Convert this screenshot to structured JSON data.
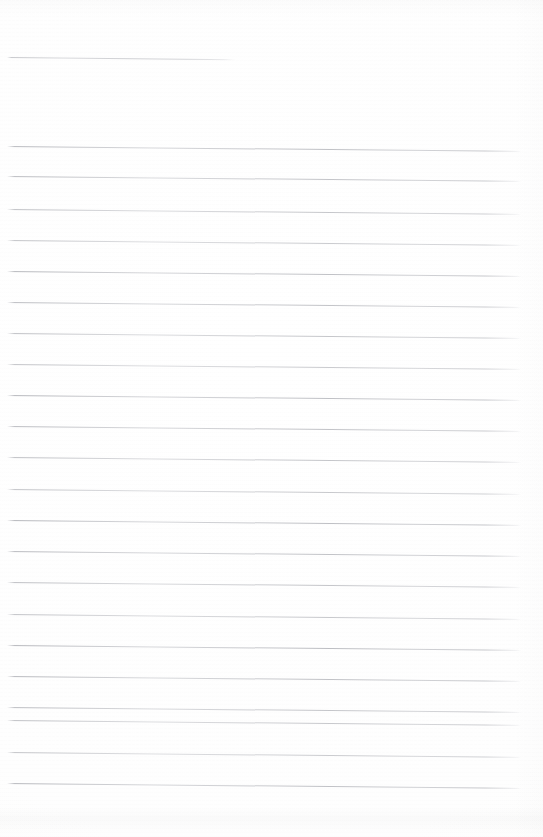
{
  "document": {
    "kind": "scanned-lined-page",
    "page_label": "",
    "background_color": "#fdfdfd",
    "line_color": "#94969e",
    "width_px": 543,
    "height_px": 837,
    "text_content": "",
    "has_handwriting": false,
    "line_count": 23
  },
  "ruling": {
    "left_margin_px": 7,
    "right_end_px": 521,
    "line_spacing_px": 31,
    "skew_deg": 0.55,
    "first_full_line_y_px": 146,
    "last_line_y_px": 783
  },
  "lines": [
    {
      "id": "line-01",
      "y": 57,
      "x": 7,
      "width": 228,
      "short": true
    },
    {
      "id": "line-02",
      "y": 146,
      "x": 7,
      "width": 514,
      "short": false
    },
    {
      "id": "line-03",
      "y": 176,
      "x": 7,
      "width": 514,
      "short": false
    },
    {
      "id": "line-04",
      "y": 209,
      "x": 7,
      "width": 514,
      "short": false
    },
    {
      "id": "line-05",
      "y": 240,
      "x": 7,
      "width": 514,
      "short": false
    },
    {
      "id": "line-06",
      "y": 271,
      "x": 7,
      "width": 514,
      "short": false
    },
    {
      "id": "line-07",
      "y": 302,
      "x": 7,
      "width": 514,
      "short": false
    },
    {
      "id": "line-08",
      "y": 333,
      "x": 7,
      "width": 514,
      "short": false
    },
    {
      "id": "line-09",
      "y": 364,
      "x": 7,
      "width": 514,
      "short": false
    },
    {
      "id": "line-10",
      "y": 395,
      "x": 7,
      "width": 514,
      "short": false
    },
    {
      "id": "line-11",
      "y": 426,
      "x": 7,
      "width": 514,
      "short": false
    },
    {
      "id": "line-12",
      "y": 457,
      "x": 7,
      "width": 514,
      "short": false
    },
    {
      "id": "line-13",
      "y": 489,
      "x": 7,
      "width": 514,
      "short": false
    },
    {
      "id": "line-14",
      "y": 520,
      "x": 7,
      "width": 514,
      "short": false
    },
    {
      "id": "line-15",
      "y": 551,
      "x": 7,
      "width": 514,
      "short": false
    },
    {
      "id": "line-16",
      "y": 582,
      "x": 7,
      "width": 514,
      "short": false
    },
    {
      "id": "line-17",
      "y": 614,
      "x": 7,
      "width": 514,
      "short": false
    },
    {
      "id": "line-18",
      "y": 645,
      "x": 7,
      "width": 514,
      "short": false
    },
    {
      "id": "line-19",
      "y": 676,
      "x": 7,
      "width": 514,
      "short": false
    },
    {
      "id": "line-20",
      "y": 707,
      "x": 7,
      "width": 514,
      "short": false
    },
    {
      "id": "line-21",
      "y": 720,
      "x": 7,
      "width": 514,
      "short": false
    },
    {
      "id": "line-22",
      "y": 752,
      "x": 7,
      "width": 514,
      "short": false
    },
    {
      "id": "line-23",
      "y": 783,
      "x": 7,
      "width": 514,
      "short": false
    }
  ]
}
